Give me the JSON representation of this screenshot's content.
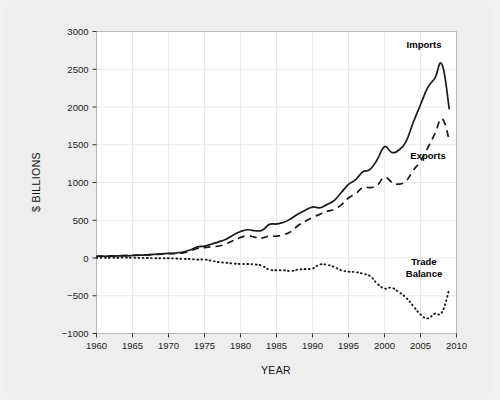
{
  "figure": {
    "background_color": "#eeeeee",
    "plot_background_color": "#ffffff",
    "frame_color": "#b8b8b8",
    "grid_color": "#e9e9e9",
    "line_color": "#1a1a1a"
  },
  "annotations": {
    "imports_label": "Imports",
    "exports_label": "Exports",
    "trade_balance_label_line1": "Trade",
    "trade_balance_label_line2": "Balance"
  },
  "chart_data": {
    "type": "line",
    "title": "",
    "subtitle": "",
    "xlabel": "YEAR",
    "ylabel": "$ BILLIONS",
    "xlim": [
      1960,
      2010
    ],
    "ylim": [
      -1000,
      3000
    ],
    "xticks": [
      1960,
      1965,
      1970,
      1975,
      1980,
      1985,
      1990,
      1995,
      2000,
      2005,
      2010
    ],
    "xtick_labels": [
      "1960",
      "1965",
      "1970",
      "1975",
      "1980",
      "1985",
      "1990",
      "1995",
      "2000",
      "2005",
      "2010"
    ],
    "yticks": [
      -1000,
      -500,
      0,
      500,
      1000,
      1500,
      2000,
      2500,
      3000
    ],
    "ytick_labels": [
      "-1000",
      "-500",
      "0",
      "500",
      "1000",
      "1500",
      "2000",
      "2500",
      "3000"
    ],
    "grid": true,
    "legend_position": "inline-annotations",
    "x": [
      1960,
      1961,
      1962,
      1963,
      1964,
      1965,
      1966,
      1967,
      1968,
      1969,
      1970,
      1971,
      1972,
      1973,
      1974,
      1975,
      1976,
      1977,
      1978,
      1979,
      1980,
      1981,
      1982,
      1983,
      1984,
      1985,
      1986,
      1987,
      1988,
      1989,
      1990,
      1991,
      1992,
      1993,
      1994,
      1995,
      1996,
      1997,
      1998,
      1999,
      2000,
      2001,
      2002,
      2003,
      2004,
      2005,
      2006,
      2007,
      2008,
      2009
    ],
    "series": [
      {
        "name": "Imports",
        "style": "solid",
        "values": [
          23,
          23,
          25,
          27,
          29,
          33,
          38,
          41,
          49,
          54,
          60,
          66,
          79,
          105,
          148,
          158,
          186,
          214,
          249,
          306,
          351,
          374,
          361,
          368,
          445,
          451,
          473,
          521,
          584,
          633,
          675,
          665,
          707,
          761,
          867,
          975,
          1038,
          1142,
          1173,
          1305,
          1475,
          1399,
          1430,
          1545,
          1798,
          2030,
          2257,
          2383,
          2560,
          1970
        ]
      },
      {
        "name": "Exports",
        "style": "dashed",
        "values": [
          26,
          26,
          28,
          30,
          34,
          36,
          39,
          42,
          46,
          51,
          57,
          59,
          67,
          92,
          126,
          138,
          149,
          159,
          186,
          232,
          272,
          294,
          276,
          265,
          291,
          289,
          310,
          349,
          431,
          487,
          536,
          578,
          617,
          643,
          703,
          795,
          851,
          934,
          933,
          965,
          1071,
          1005,
          978,
          1020,
          1161,
          1283,
          1457,
          1646,
          1843,
          1560
        ]
      },
      {
        "name": "Trade Balance",
        "style": "dotted",
        "values": [
          3,
          4,
          3,
          4,
          5,
          3,
          1,
          1,
          -3,
          -3,
          -3,
          -7,
          -12,
          -13,
          -22,
          -20,
          -37,
          -55,
          -63,
          -74,
          -79,
          -80,
          -85,
          -103,
          -154,
          -162,
          -163,
          -172,
          -153,
          -146,
          -139,
          -87,
          -90,
          -118,
          -164,
          -180,
          -187,
          -208,
          -240,
          -340,
          -404,
          -394,
          -452,
          -525,
          -637,
          -747,
          -800,
          -737,
          -717,
          -410
        ]
      }
    ]
  }
}
